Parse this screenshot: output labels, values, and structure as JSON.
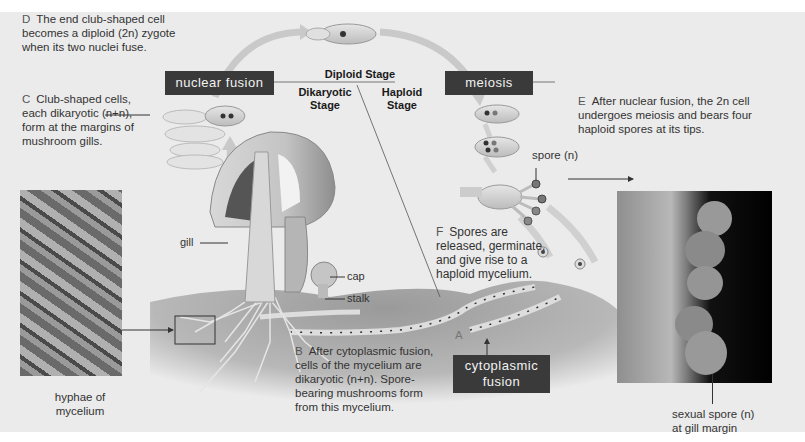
{
  "diagram": {
    "stage_labels": {
      "diploid": "Diploid Stage",
      "dikaryotic": [
        "Dikaryotic",
        "Stage"
      ],
      "haploid": [
        "Haploid",
        "Stage"
      ]
    },
    "process_boxes": {
      "nuclear_fusion": "nuclear fusion",
      "meiosis": "meiosis",
      "cytoplasmic_fusion": [
        "cytoplasmic",
        "fusion"
      ]
    },
    "captions": {
      "A": {
        "letter": "A",
        "text": ""
      },
      "B": {
        "letter": "B",
        "lines": [
          "After cytoplasmic fusion,",
          "cells of the mycelium are",
          "dikaryotic (n+n). Spore-",
          "bearing mushrooms form",
          "from this mycelium."
        ]
      },
      "C": {
        "letter": "C",
        "lines": [
          "Club-shaped cells,",
          "each dikaryotic (n+n),",
          "form at the margins of",
          "mushroom gills."
        ]
      },
      "D": {
        "letter": "D",
        "lines": [
          "The end club-shaped cell",
          "becomes a diploid (2n) zygote",
          "when its two nuclei fuse."
        ]
      },
      "E": {
        "letter": "E",
        "lines": [
          "After nuclear fusion, the 2n cell",
          "undergoes meiosis and bears four",
          "haploid spores at its tips."
        ]
      },
      "F": {
        "letter": "F",
        "lines": [
          "Spores are",
          "released, germinate,",
          "and give rise to a",
          "haploid mycelium."
        ]
      }
    },
    "part_labels": {
      "gill": "gill",
      "cap": "cap",
      "stalk": "stalk",
      "spore": "spore (n)"
    },
    "photos": {
      "hyphae": {
        "caption": [
          "hyphae of",
          "mycelium"
        ]
      },
      "spores": {
        "caption": [
          "sexual spore (n)",
          "at gill margin"
        ]
      }
    },
    "colors": {
      "background": "#ebebeb",
      "label_box": "#3a3a3a",
      "arrow": "#c4c4c4",
      "soil": "#8a8a8a"
    }
  }
}
